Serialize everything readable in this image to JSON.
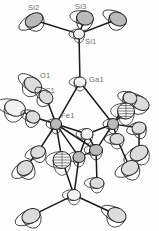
{
  "figure": {
    "type": "ortep-crystal-structure-diagram",
    "width": 159,
    "height": 231,
    "background_color": "#fdfdfd",
    "line_color": "#1a1a1a",
    "ellipsoid_outline_color": "#3a3a3a",
    "ellipsoid_fill_color": "#e8e8e8",
    "label_color": "#6e6e6e"
  },
  "labels": [
    {
      "id": "Si2",
      "text": "Si2",
      "x": 28,
      "y": 4
    },
    {
      "id": "Si3",
      "text": "Si3",
      "x": 75,
      "y": 3
    },
    {
      "id": "Si1",
      "text": "Si1",
      "x": 85,
      "y": 38
    },
    {
      "id": "O1",
      "text": "O1",
      "x": 40,
      "y": 72
    },
    {
      "id": "Ga1",
      "text": "Ga1",
      "x": 89,
      "y": 76
    },
    {
      "id": "C1",
      "text": "C1",
      "x": 45,
      "y": 87
    },
    {
      "id": "Fe1",
      "text": "Fe1",
      "x": 61,
      "y": 112
    }
  ],
  "atoms": [
    {
      "name": "Si2",
      "x": 34,
      "y": 20,
      "rx": 9.5,
      "ry": 6.5,
      "rot": -30,
      "shade": "dark"
    },
    {
      "name": "Si3",
      "x": 85,
      "y": 18,
      "rx": 8.5,
      "ry": 7.0,
      "rot": 10,
      "shade": "dark"
    },
    {
      "name": "Si4",
      "x": 118,
      "y": 19,
      "rx": 9.0,
      "ry": 6.5,
      "rot": 25,
      "shade": "dark"
    },
    {
      "name": "Si1",
      "x": 79,
      "y": 34,
      "rx": 5.5,
      "ry": 5.0,
      "rot": 0,
      "shade": "light"
    },
    {
      "name": "Ga1",
      "x": 80,
      "y": 82,
      "rx": 6.0,
      "ry": 5.0,
      "rot": 0,
      "shade": "light"
    },
    {
      "name": "O1",
      "x": 33,
      "y": 85,
      "rx": 9.5,
      "ry": 7.0,
      "rot": 35,
      "shade": "mid"
    },
    {
      "name": "C1",
      "x": 46,
      "y": 97,
      "rx": 7.5,
      "ry": 6.0,
      "rot": 40,
      "shade": "mid"
    },
    {
      "name": "C2",
      "x": 15,
      "y": 108,
      "rx": 10.5,
      "ry": 8.0,
      "rot": 15,
      "shade": "light"
    },
    {
      "name": "O2",
      "x": 33,
      "y": 117,
      "rx": 7.0,
      "ry": 6.0,
      "rot": 20,
      "shade": "mid"
    },
    {
      "name": "Fe1",
      "x": 56,
      "y": 124,
      "rx": 5.5,
      "ry": 5.5,
      "rot": 0,
      "shade": "dark"
    },
    {
      "name": "Fe2",
      "x": 113,
      "y": 124,
      "rx": 5.5,
      "ry": 5.5,
      "rot": 0,
      "shade": "dark"
    },
    {
      "name": "C3",
      "x": 38,
      "y": 152,
      "rx": 7.5,
      "ry": 6.0,
      "rot": -20,
      "shade": "mid"
    },
    {
      "name": "O3",
      "x": 25,
      "y": 168,
      "rx": 8.5,
      "ry": 7.0,
      "rot": -35,
      "shade": "mid"
    },
    {
      "name": "C4",
      "x": 140,
      "y": 103,
      "rx": 10.0,
      "ry": 6.5,
      "rot": 30,
      "shade": "mid"
    },
    {
      "name": "O4",
      "x": 130,
      "y": 98,
      "rx": 7.0,
      "ry": 6.0,
      "rot": 15,
      "shade": "mid"
    },
    {
      "name": "C5",
      "x": 126,
      "y": 111,
      "rx": 8.5,
      "ry": 8.0,
      "rot": 0,
      "shade": "hatched"
    },
    {
      "name": "O5",
      "x": 139,
      "y": 128,
      "rx": 7.0,
      "ry": 6.0,
      "rot": -15,
      "shade": "mid"
    },
    {
      "name": "C6",
      "x": 139,
      "y": 153,
      "rx": 9.5,
      "ry": 7.0,
      "rot": -30,
      "shade": "mid"
    },
    {
      "name": "C7",
      "x": 130,
      "y": 168,
      "rx": 9.0,
      "ry": 7.0,
      "rot": -25,
      "shade": "mid"
    },
    {
      "name": "Ge1",
      "x": 87,
      "y": 134,
      "rx": 6.0,
      "ry": 5.5,
      "rot": 0,
      "shade": "light"
    },
    {
      "name": "Ge2",
      "x": 96,
      "y": 150,
      "rx": 6.5,
      "ry": 5.5,
      "rot": 0,
      "shade": "dark"
    },
    {
      "name": "Ge3",
      "x": 79,
      "y": 157,
      "rx": 6.0,
      "ry": 5.5,
      "rot": 0,
      "shade": "dark"
    },
    {
      "name": "C8",
      "x": 62,
      "y": 160,
      "rx": 9.0,
      "ry": 8.5,
      "rot": 0,
      "shade": "hatched"
    },
    {
      "name": "C9",
      "x": 97,
      "y": 183,
      "rx": 7.0,
      "ry": 5.5,
      "rot": 0,
      "shade": "mid"
    },
    {
      "name": "Si5",
      "x": 74,
      "y": 195,
      "rx": 6.5,
      "ry": 5.5,
      "rot": 0,
      "shade": "light"
    },
    {
      "name": "C10",
      "x": 31,
      "y": 216,
      "rx": 9.5,
      "ry": 7.0,
      "rot": -25,
      "shade": "mid"
    },
    {
      "name": "C11",
      "x": 117,
      "y": 215,
      "rx": 9.5,
      "ry": 7.0,
      "rot": 25,
      "shade": "mid"
    },
    {
      "name": "C12",
      "x": 117,
      "y": 139,
      "rx": 7.0,
      "ry": 5.5,
      "rot": 0,
      "shade": "mid"
    }
  ],
  "bonds": [
    {
      "from": "Si1",
      "to": "Si2"
    },
    {
      "from": "Si1",
      "to": "Si3"
    },
    {
      "from": "Si1",
      "to": "Si4"
    },
    {
      "from": "Si1",
      "to": "Ga1"
    },
    {
      "from": "Ga1",
      "to": "Fe1"
    },
    {
      "from": "Ga1",
      "to": "Fe2"
    },
    {
      "from": "Fe1",
      "to": "C1"
    },
    {
      "from": "C1",
      "to": "O1"
    },
    {
      "from": "Fe1",
      "to": "O2"
    },
    {
      "from": "O2",
      "to": "C2"
    },
    {
      "from": "Fe1",
      "to": "C3"
    },
    {
      "from": "C3",
      "to": "O3"
    },
    {
      "from": "Fe1",
      "to": "Ge1"
    },
    {
      "from": "Fe1",
      "to": "Ge2"
    },
    {
      "from": "Fe1",
      "to": "Ge3"
    },
    {
      "from": "Fe1",
      "to": "C8"
    },
    {
      "from": "Fe2",
      "to": "O4"
    },
    {
      "from": "O4",
      "to": "C4"
    },
    {
      "from": "Fe2",
      "to": "C5"
    },
    {
      "from": "Fe2",
      "to": "O5"
    },
    {
      "from": "O5",
      "to": "C6"
    },
    {
      "from": "Fe2",
      "to": "C12"
    },
    {
      "from": "C12",
      "to": "C7"
    },
    {
      "from": "Fe2",
      "to": "Ge1"
    },
    {
      "from": "Fe2",
      "to": "Ge2"
    },
    {
      "from": "Ge1",
      "to": "Ge2"
    },
    {
      "from": "Ge1",
      "to": "Ge3"
    },
    {
      "from": "Ge2",
      "to": "Ge3"
    },
    {
      "from": "Ge2",
      "to": "C9"
    },
    {
      "from": "Ge3",
      "to": "Si5"
    },
    {
      "from": "C8",
      "to": "Si5"
    },
    {
      "from": "Si5",
      "to": "C10"
    },
    {
      "from": "Si5",
      "to": "C11"
    }
  ]
}
